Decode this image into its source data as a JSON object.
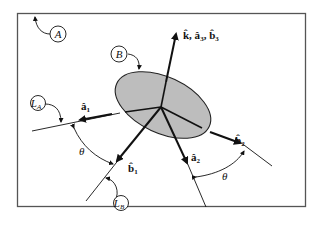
{
  "diagram": {
    "colors": {
      "frame": "#555555",
      "ink": "#111111",
      "body_fill": "#bdbdbd",
      "background": "#ffffff"
    },
    "frame_label": "A",
    "body_label": "B",
    "line_labels": {
      "LA": {
        "main": "L",
        "sub": "A"
      },
      "LB": {
        "main": "L",
        "sub": "B"
      }
    },
    "vectors": {
      "k_a3_b3": {
        "text": "k̂, â",
        "sub1": "3",
        "mid": ", b̂",
        "sub2": "3"
      },
      "a1": {
        "base": "â",
        "sub": "1"
      },
      "b1": {
        "base": "b̂",
        "sub": "1"
      },
      "a2": {
        "base": "â",
        "sub": "2"
      },
      "b2": {
        "base": "b̂",
        "sub": "2"
      }
    },
    "angles": {
      "theta_left": "θ",
      "theta_right": "θ"
    }
  }
}
